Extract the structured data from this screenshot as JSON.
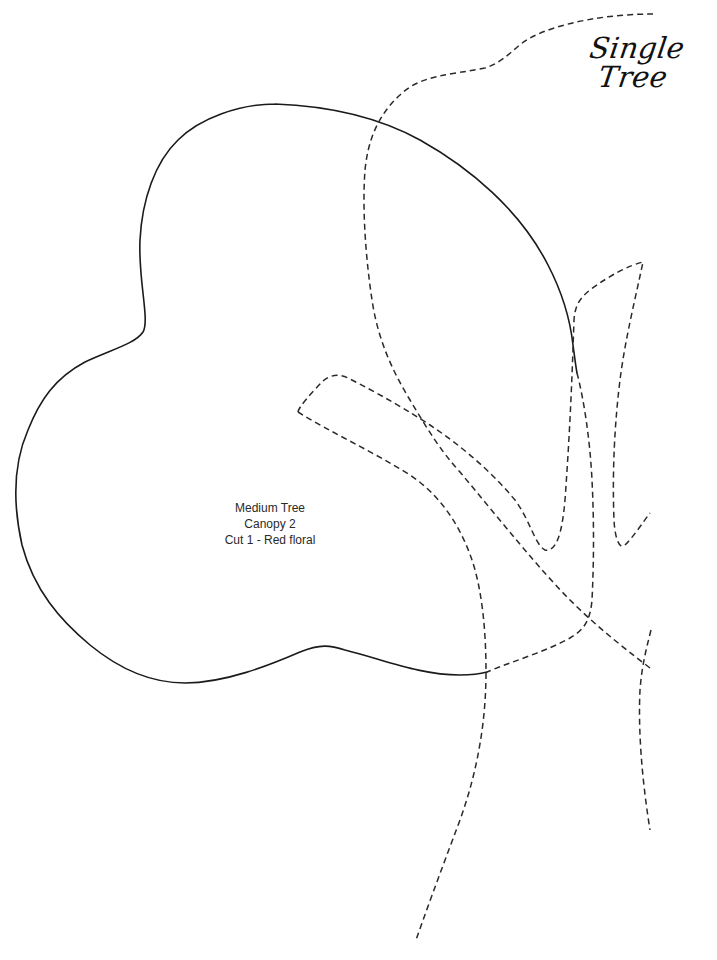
{
  "header": {
    "title": "Single Tree"
  },
  "piece": {
    "lines": [
      "Medium Tree",
      "Canopy 2",
      "Cut 1 - Red floral"
    ]
  },
  "legend": {
    "solid_line": "cutting outline (canopy piece)",
    "dashed_line": "placement guides (other pieces / trunk / branches)"
  },
  "colors": {
    "background": "#ffffff",
    "line": "#1a1a1a",
    "text": "#2a2a2a"
  }
}
